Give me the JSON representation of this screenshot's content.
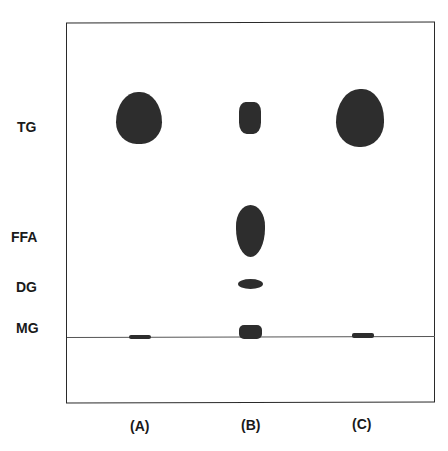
{
  "figure": {
    "type": "thin-layer chromatogram",
    "row_labels": [
      {
        "id": "tg",
        "text": "TG",
        "top": 119,
        "left": 17
      },
      {
        "id": "ffa",
        "text": "FFA",
        "top": 229,
        "left": 11
      },
      {
        "id": "dg",
        "text": "DG",
        "top": 279,
        "left": 16
      },
      {
        "id": "mg",
        "text": "MG",
        "top": 320,
        "left": 16
      }
    ],
    "lane_labels": [
      {
        "id": "a",
        "text": "(A)",
        "left": 130,
        "top": 418
      },
      {
        "id": "b",
        "text": "(B)",
        "left": 241,
        "top": 417
      },
      {
        "id": "c",
        "text": "(C)",
        "left": 352,
        "top": 416
      }
    ],
    "spots": [
      {
        "lane": "A",
        "band": "TG",
        "left": 116,
        "top": 92,
        "width": 46,
        "height": 52,
        "radius": "48% 48% 45% 45% / 58% 58% 42% 42%"
      },
      {
        "lane": "A",
        "band": "origin",
        "left": 129,
        "top": 335,
        "width": 22,
        "height": 4,
        "radius": "2px"
      },
      {
        "lane": "B",
        "band": "TG",
        "left": 239,
        "top": 102,
        "width": 22,
        "height": 32,
        "radius": "30% 30% 35% 35%"
      },
      {
        "lane": "B",
        "band": "FFA",
        "left": 236,
        "top": 205,
        "width": 29,
        "height": 52,
        "radius": "50% / 40% 40% 55% 55%"
      },
      {
        "lane": "B",
        "band": "DG",
        "left": 238,
        "top": 279,
        "width": 25,
        "height": 10,
        "radius": "50%"
      },
      {
        "lane": "B",
        "band": "MG",
        "left": 239,
        "top": 325,
        "width": 23,
        "height": 14,
        "radius": "5px"
      },
      {
        "lane": "C",
        "band": "TG",
        "left": 336,
        "top": 89,
        "width": 48,
        "height": 58,
        "radius": "52% 48% 50% 50% / 60% 55% 45% 45%"
      },
      {
        "lane": "C",
        "band": "origin",
        "left": 352,
        "top": 333,
        "width": 22,
        "height": 5,
        "radius": "2px"
      }
    ]
  }
}
